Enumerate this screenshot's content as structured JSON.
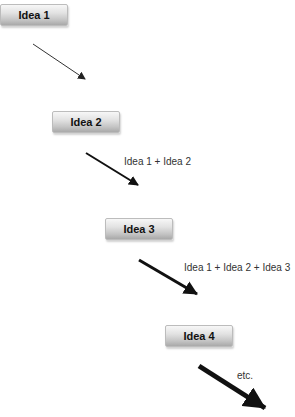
{
  "diagram": {
    "ideas": [
      {
        "label": "Idea 1"
      },
      {
        "label": "Idea 2"
      },
      {
        "label": "Idea 3"
      },
      {
        "label": "Idea 4"
      }
    ],
    "sums": [
      {
        "label": "Idea 1 + Idea 2"
      },
      {
        "label": "Idea 1 + Idea 2 + Idea 3"
      },
      {
        "label": "etc."
      }
    ],
    "colors": {
      "arrow": "#111111",
      "text": "#333333"
    }
  }
}
